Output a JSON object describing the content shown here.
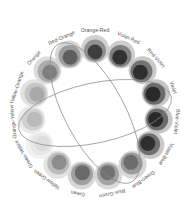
{
  "diagram": {
    "type": "color-wheel",
    "center": [
      95,
      113
    ],
    "ring_radius": 64,
    "label_radius": 82,
    "swatches": [
      {
        "label": "Orange-Red",
        "angle": -90,
        "tones": [
          "#c9c9c9",
          "#8c8c8c",
          "#3a3a3a"
        ]
      },
      {
        "label": "Violet-Red",
        "angle": -66,
        "tones": [
          "#c4c4c4",
          "#7a7a7a",
          "#2e2e2e"
        ]
      },
      {
        "label": "Red-Violet",
        "angle": -42,
        "tones": [
          "#c0c0c0",
          "#6f6f6f",
          "#2a2a2a"
        ]
      },
      {
        "label": "Violet",
        "angle": -18,
        "tones": [
          "#bdbdbd",
          "#666666",
          "#262626"
        ]
      },
      {
        "label": "Blue-Violet",
        "angle": 6,
        "tones": [
          "#bdbdbd",
          "#666666",
          "#262626"
        ]
      },
      {
        "label": "Violet-Blue",
        "angle": 30,
        "tones": [
          "#c0c0c0",
          "#6c6c6c",
          "#2b2b2b"
        ]
      },
      {
        "label": "Green-Blue",
        "angle": 54,
        "tones": [
          "#d2d2d2",
          "#9a9a9a",
          "#6a6a6a"
        ]
      },
      {
        "label": "Blue-Green",
        "angle": 78,
        "tones": [
          "#d2d2d2",
          "#a0a0a0",
          "#707070"
        ]
      },
      {
        "label": "Green",
        "angle": 102,
        "tones": [
          "#d0d0d0",
          "#9c9c9c",
          "#666666"
        ]
      },
      {
        "label": "Yellow-Green",
        "angle": 126,
        "tones": [
          "#dedede",
          "#b8b8b8",
          "#8a8a8a"
        ]
      },
      {
        "label": "Green-Yellow",
        "angle": 150,
        "tones": [
          "#f0f0f0",
          "#e6e6e6",
          "#dcdcdc"
        ]
      },
      {
        "label": "Orange-Yellow",
        "angle": 174,
        "tones": [
          "#e6e6e6",
          "#cfcfcf",
          "#b8b8b8"
        ]
      },
      {
        "label": "Yellow-Orange",
        "angle": 198,
        "tones": [
          "#dcdcdc",
          "#c2c2c2",
          "#a8a8a8"
        ]
      },
      {
        "label": "Orange",
        "angle": 222,
        "tones": [
          "#d6d6d6",
          "#aaaaaa",
          "#7c7c7c"
        ]
      },
      {
        "label": "Red-Orange",
        "angle": 246,
        "tones": [
          "#cfcfcf",
          "#9a9a9a",
          "#5c5c5c"
        ]
      }
    ],
    "ellipses": [
      {
        "cx": 95,
        "cy": 113,
        "rx": 78,
        "ry": 30,
        "rotate": -12,
        "stroke": "#8a8a8a"
      },
      {
        "cx": 95,
        "cy": 113,
        "rx": 78,
        "ry": 30,
        "rotate": 62,
        "stroke": "#8a8a8a"
      }
    ]
  }
}
